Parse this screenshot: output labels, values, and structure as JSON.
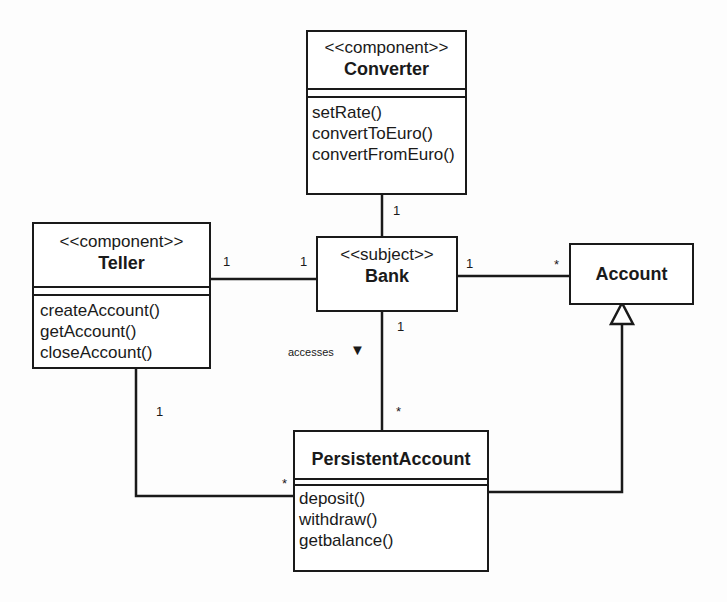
{
  "diagram": {
    "type": "uml-class-diagram",
    "classes": [
      {
        "id": "converter",
        "stereotype": "<<component>>",
        "name": "Converter",
        "operations": [
          "setRate()",
          "convertToEuro()",
          "convertFromEuro()"
        ]
      },
      {
        "id": "teller",
        "stereotype": "<<component>>",
        "name": "Teller",
        "operations": [
          "createAccount()",
          "getAccount()",
          "closeAccount()"
        ]
      },
      {
        "id": "bank",
        "stereotype": "<<subject>>",
        "name": "Bank",
        "operations": []
      },
      {
        "id": "account",
        "stereotype": "",
        "name": "Account",
        "operations": []
      },
      {
        "id": "persistent_account",
        "stereotype": "",
        "name": "PersistentAccount",
        "operations": [
          "deposit()",
          "withdraw()",
          "getbalance()"
        ]
      }
    ],
    "relationships": [
      {
        "from": "Converter",
        "to": "Bank",
        "type": "association",
        "from_mult": "",
        "to_mult": "1"
      },
      {
        "from": "Teller",
        "to": "Bank",
        "type": "association",
        "from_mult": "1",
        "to_mult": "1"
      },
      {
        "from": "Bank",
        "to": "Account",
        "type": "association",
        "from_mult": "1",
        "to_mult": "*"
      },
      {
        "from": "Bank",
        "to": "PersistentAccount",
        "type": "association",
        "label": "accesses",
        "from_mult": "1",
        "to_mult": "*"
      },
      {
        "from": "Teller",
        "to": "PersistentAccount",
        "type": "association",
        "from_mult": "1",
        "to_mult": "*"
      },
      {
        "from": "PersistentAccount",
        "to": "Account",
        "type": "generalization"
      }
    ],
    "labels": {
      "conv_bank_mult": "1",
      "teller_bank_mult_left": "1",
      "teller_bank_mult_right": "1",
      "bank_account_mult_left": "1",
      "bank_account_mult_right": "*",
      "bank_pa_mult_top": "1",
      "bank_pa_mult_bottom": "*",
      "accesses": "accesses",
      "accesses_arrow": "▼",
      "teller_pa_mult_top": "1",
      "teller_pa_mult_right": "*"
    }
  }
}
